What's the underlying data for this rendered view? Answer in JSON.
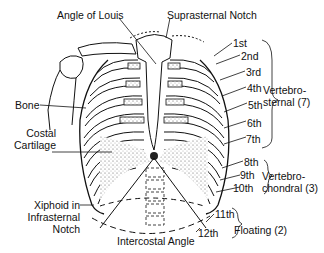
{
  "diagram": {
    "colors": {
      "ink": "#111111",
      "background": "#ffffff",
      "stipple": "#555555"
    },
    "top_labels": {
      "angle_of_louis": "Angle of Louis",
      "suprasternal_notch": "Suprasternal Notch"
    },
    "left_labels": {
      "bone": "Bone",
      "costal_cartilage_1": "Costal",
      "costal_cartilage_2": "Cartilage",
      "xiphoid_1": "Xiphoid in",
      "xiphoid_2": "Infrasternal",
      "xiphoid_3": "Notch"
    },
    "bottom_labels": {
      "intercostal_angle": "Intercostal Angle"
    },
    "ribs": [
      "1st",
      "2nd",
      "3rd",
      "4th",
      "5th",
      "6th",
      "7th",
      "8th",
      "9th",
      "10th",
      "11th",
      "12th"
    ],
    "groups": {
      "vertebrosternal_1": "Vertebro-",
      "vertebrosternal_2": "sternal (7)",
      "vertebrochondral_1": "Vertebro-",
      "vertebrochondral_2": "chondral (3)",
      "floating": "Floating (2)"
    }
  }
}
